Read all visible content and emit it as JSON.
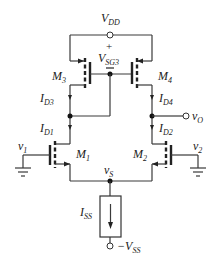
{
  "diagram": {
    "supply_top": {
      "main": "V",
      "sub": "DD"
    },
    "supply_bottom": {
      "prefix": "−V",
      "sub": "SS"
    },
    "vsg_label": {
      "main": "V",
      "sub": "SG3"
    },
    "vsg_plus": "+",
    "vsg_minus": "−",
    "transistors": [
      {
        "id": "M3",
        "main": "M",
        "sub": "3",
        "type": "PMOS"
      },
      {
        "id": "M4",
        "main": "M",
        "sub": "4",
        "type": "PMOS"
      },
      {
        "id": "M1",
        "main": "M",
        "sub": "1",
        "type": "NMOS"
      },
      {
        "id": "M2",
        "main": "M",
        "sub": "2",
        "type": "NMOS"
      }
    ],
    "currents": [
      {
        "id": "ID3",
        "main": "I",
        "sub": "D3"
      },
      {
        "id": "ID1",
        "main": "I",
        "sub": "D1"
      },
      {
        "id": "ID4",
        "main": "I",
        "sub": "D4"
      },
      {
        "id": "ID2",
        "main": "I",
        "sub": "D2"
      },
      {
        "id": "ISS",
        "main": "I",
        "sub": "SS"
      }
    ],
    "inputs": [
      {
        "id": "v1",
        "main": "v",
        "sub": "1"
      },
      {
        "id": "v2",
        "main": "v",
        "sub": "2"
      }
    ],
    "output": {
      "main": "v",
      "sub": "O"
    },
    "source_node": {
      "main": "v",
      "sub": "S"
    }
  }
}
